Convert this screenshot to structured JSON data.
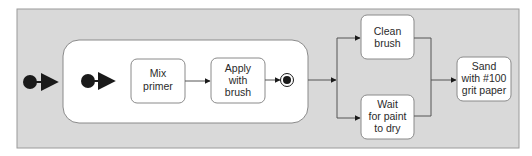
{
  "diagram": {
    "type": "UML activity diagram",
    "colors": {
      "outer_background": "#d9d9d9",
      "outer_border": "#9a9a9a",
      "node_fill": "#ffffff",
      "node_border": "#8a8a8a",
      "line": "#555555",
      "marker": "#1a1a1a"
    },
    "nodes": {
      "mix_primer": {
        "lines": [
          "Mix",
          "primer"
        ]
      },
      "apply_with_brush": {
        "lines": [
          "Apply",
          "with",
          "brush"
        ]
      },
      "clean_brush": {
        "lines": [
          "Clean",
          "brush"
        ]
      },
      "wait_for_paint": {
        "lines": [
          "Wait",
          "for paint",
          "to dry"
        ]
      },
      "sand": {
        "lines": [
          "Sand",
          "with #100",
          "grit paper"
        ]
      }
    }
  }
}
